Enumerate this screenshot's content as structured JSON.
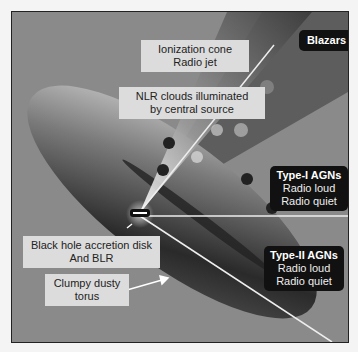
{
  "diagram": {
    "labels": {
      "ionization_cone": [
        "Ionization cone",
        "Radio jet"
      ],
      "nlr_clouds": [
        "NLR clouds illuminated",
        "by central source"
      ],
      "blazars": "Blazars",
      "type1": {
        "title": "Type-I AGNs",
        "lines": [
          "Radio loud",
          "Radio quiet"
        ]
      },
      "type2": {
        "title": "Type-II AGNs",
        "lines": [
          "Radio loud",
          "Radio quiet"
        ]
      },
      "black_hole": [
        "Black hole accretion disk",
        "And BLR"
      ],
      "torus": [
        "Clumpy dusty",
        "torus"
      ]
    },
    "colors": {
      "background": "#8a8a8a",
      "cone": "#4a4a4a",
      "torus": "#2a2a2a",
      "light_label": "#dcdcdc",
      "dark_label": "#111111"
    }
  }
}
